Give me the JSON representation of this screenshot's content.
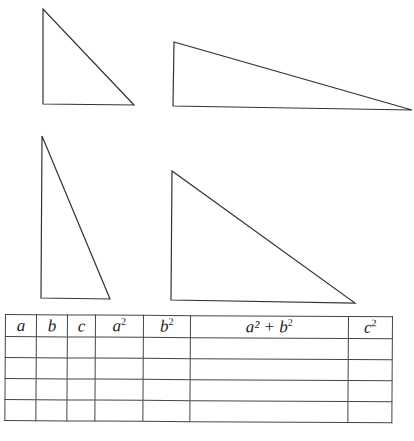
{
  "triangles": [
    {
      "id": "t1",
      "points": "43,9 43,104 134,105"
    },
    {
      "id": "t2",
      "points": "174,42 173,106 412,110"
    },
    {
      "id": "t3",
      "points": "42,136 41,298 110,299"
    },
    {
      "id": "t4",
      "points": "172,171 171,300 355,303"
    }
  ],
  "table": {
    "headers": [
      {
        "base": "a",
        "sup": ""
      },
      {
        "base": "b",
        "sup": ""
      },
      {
        "base": "c",
        "sup": ""
      },
      {
        "base": "a",
        "sup": "2"
      },
      {
        "base": "b",
        "sup": "2"
      },
      {
        "base": "a² + b",
        "sup": "2"
      },
      {
        "base": "c",
        "sup": "2"
      }
    ],
    "rows": [
      [
        "",
        "",
        "",
        "",
        "",
        "",
        ""
      ],
      [
        "",
        "",
        "",
        "",
        "",
        "",
        ""
      ],
      [
        "",
        "",
        "",
        "",
        "",
        "",
        ""
      ],
      [
        "",
        "",
        "",
        "",
        "",
        "",
        ""
      ]
    ]
  }
}
